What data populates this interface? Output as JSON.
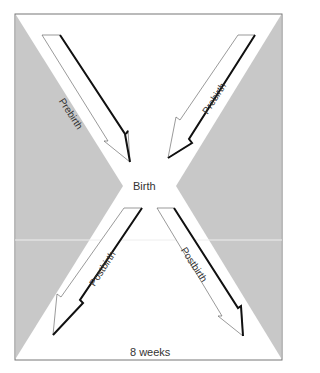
{
  "diagram": {
    "center_label": "Birth",
    "bottom_label": "8 weeks",
    "arrows": [
      {
        "id": "top-left",
        "label": "Prebirth"
      },
      {
        "id": "top-right",
        "label": "Prebirth"
      },
      {
        "id": "bottom-left",
        "label": "Postbirth"
      },
      {
        "id": "bottom-right",
        "label": "Postbirth"
      }
    ],
    "colors": {
      "shade": "#c8c8c8",
      "frame": "#777777",
      "arrow_edge": "#111111"
    }
  }
}
